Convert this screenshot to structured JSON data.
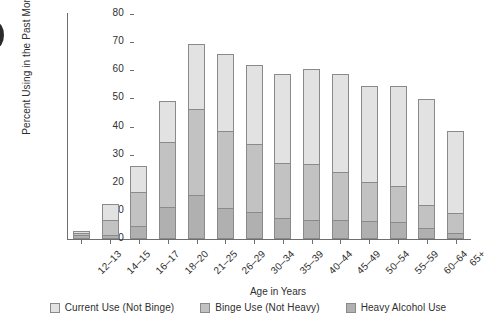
{
  "chart_data": {
    "type": "bar",
    "stacked": true,
    "title": "",
    "xlabel": "Age in Years",
    "ylabel": "Percent Using in the Past Month",
    "ylim": [
      0,
      80
    ],
    "yticks": [
      0,
      10,
      20,
      30,
      40,
      50,
      60,
      70,
      80
    ],
    "grid": false,
    "legend_position": "bottom",
    "categories": [
      "12–13",
      "14–15",
      "16–17",
      "18–20",
      "21–25",
      "26–29",
      "30–34",
      "35–39",
      "40–44",
      "45–49",
      "50–54",
      "55–59",
      "60–64",
      "65+"
    ],
    "series": [
      {
        "name": "Heavy Alcohol Use",
        "color": "#b0b0b0",
        "values": [
          1.5,
          1.3,
          4.5,
          11.4,
          15.5,
          10.9,
          9.6,
          7.4,
          6.8,
          6.8,
          6.4,
          6.0,
          3.8,
          2.1
        ]
      },
      {
        "name": "Binge Use (Not Heavy)",
        "color": "#c2c2c2",
        "values": [
          1.0,
          5.7,
          12.6,
          23.3,
          31.0,
          28.0,
          24.4,
          19.9,
          20.4,
          17.3,
          14.2,
          13.2,
          8.8,
          7.5
        ]
      },
      {
        "name": "Current Use (Not Binge)",
        "color": "#e2e2e2",
        "values": [
          0.9,
          6.0,
          9.4,
          15.0,
          23.5,
          27.6,
          28.5,
          32.2,
          33.8,
          35.4,
          34.4,
          35.8,
          37.9,
          29.5
        ]
      }
    ],
    "cumulative_tops": {
      "heavy": [
        1.5,
        1.3,
        4.5,
        11.4,
        15.5,
        10.9,
        9.6,
        7.4,
        6.8,
        6.8,
        6.4,
        6.0,
        3.8,
        2.1
      ],
      "binge": [
        2.5,
        7.0,
        17.1,
        34.7,
        46.5,
        38.9,
        34.0,
        27.3,
        27.2,
        24.1,
        20.6,
        19.2,
        12.6,
        9.6
      ],
      "total": [
        3.4,
        13.0,
        26.5,
        49.7,
        70.0,
        66.5,
        62.5,
        59.5,
        61.0,
        59.5,
        55.0,
        55.0,
        50.5,
        39.1
      ]
    }
  },
  "legend": {
    "items": [
      {
        "label": "Current Use (Not Binge)",
        "key": "current"
      },
      {
        "label": "Binge Use (Not Heavy)",
        "key": "binge"
      },
      {
        "label": "Heavy Alcohol Use",
        "key": "heavy"
      }
    ]
  }
}
